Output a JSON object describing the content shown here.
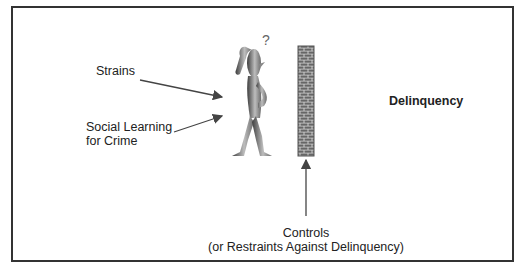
{
  "diagram": {
    "labels": {
      "strains": "Strains",
      "social_learning_line1": "Social Learning",
      "social_learning_line2": "for Crime",
      "delinquency": "Delinquency",
      "controls_line1": "Controls",
      "controls_line2": "(or Restraints Against Delinquency)"
    },
    "figure": {
      "question_mark": "?"
    },
    "colors": {
      "frame": "#333333",
      "text": "#222222",
      "figure_dark": "#4a4a4a",
      "figure_light": "#c8c8c8",
      "brick": "#6b6b6b",
      "mortar": "#cfcfcf",
      "arrow": "#444444"
    }
  }
}
